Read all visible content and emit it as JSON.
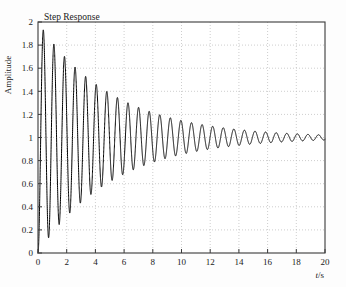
{
  "chart_data": {
    "type": "line",
    "title": "Step Response",
    "xlabel": "t/s",
    "ylabel": "Amplitude",
    "xlim": [
      0,
      20
    ],
    "ylim": [
      0,
      2
    ],
    "xticks": [
      0,
      2,
      4,
      6,
      8,
      10,
      12,
      14,
      16,
      18,
      20
    ],
    "xtick_labels": [
      "0",
      "2",
      "4",
      "6",
      "8",
      "10",
      "12",
      "14",
      "16",
      "18",
      "20"
    ],
    "yticks": [
      0,
      0.2,
      0.4,
      0.6,
      0.8,
      1,
      1.2,
      1.4,
      1.6,
      1.8,
      2
    ],
    "ytick_labels": [
      "0",
      "0.2",
      "0.4",
      "0.6",
      "0.8",
      "1",
      "1.2",
      "1.4",
      "1.6",
      "1.8",
      "2"
    ],
    "grid": true,
    "grid_style": "dotted",
    "grid_color": "#b9b9b9",
    "line_color": "#000000",
    "line_width": 1.0,
    "legend": null,
    "annotations": [],
    "model": {
      "steady_state": 1.0,
      "damping_ratio": 0.0225,
      "natural_frequency": 8.52,
      "damped_frequency": 8.518,
      "damped_period": 0.7376
    },
    "peaks": [
      {
        "t": 0.36,
        "y": 1.96
      },
      {
        "t": 1.1,
        "y": 1.83
      },
      {
        "t": 1.84,
        "y": 1.72
      },
      {
        "t": 2.57,
        "y": 1.63
      },
      {
        "t": 3.31,
        "y": 1.55
      },
      {
        "t": 4.05,
        "y": 1.48
      },
      {
        "t": 4.79,
        "y": 1.42
      },
      {
        "t": 5.52,
        "y": 1.36
      },
      {
        "t": 6.26,
        "y": 1.31
      },
      {
        "t": 7.0,
        "y": 1.28
      },
      {
        "t": 7.73,
        "y": 1.25
      },
      {
        "t": 8.47,
        "y": 1.22
      },
      {
        "t": 9.21,
        "y": 1.2
      },
      {
        "t": 9.95,
        "y": 1.18
      },
      {
        "t": 10.68,
        "y": 1.16
      },
      {
        "t": 11.42,
        "y": 1.14
      },
      {
        "t": 12.16,
        "y": 1.13
      },
      {
        "t": 12.89,
        "y": 1.12
      },
      {
        "t": 13.63,
        "y": 1.11
      },
      {
        "t": 14.37,
        "y": 1.1
      },
      {
        "t": 15.11,
        "y": 1.09
      },
      {
        "t": 15.84,
        "y": 1.08
      },
      {
        "t": 16.58,
        "y": 1.08
      },
      {
        "t": 17.32,
        "y": 1.07
      },
      {
        "t": 18.05,
        "y": 1.07
      },
      {
        "t": 18.79,
        "y": 1.06
      },
      {
        "t": 19.53,
        "y": 1.06
      }
    ],
    "troughs": [
      {
        "t": 0.73,
        "y": 0.19
      },
      {
        "t": 1.47,
        "y": 0.3
      },
      {
        "t": 2.21,
        "y": 0.39
      },
      {
        "t": 2.94,
        "y": 0.49
      },
      {
        "t": 3.68,
        "y": 0.56
      },
      {
        "t": 4.42,
        "y": 0.63
      },
      {
        "t": 5.16,
        "y": 0.69
      },
      {
        "t": 5.89,
        "y": 0.74
      },
      {
        "t": 6.63,
        "y": 0.78
      },
      {
        "t": 7.37,
        "y": 0.8
      },
      {
        "t": 8.1,
        "y": 0.82
      },
      {
        "t": 8.84,
        "y": 0.84
      },
      {
        "t": 9.58,
        "y": 0.86
      },
      {
        "t": 10.32,
        "y": 0.87
      },
      {
        "t": 11.05,
        "y": 0.88
      },
      {
        "t": 11.79,
        "y": 0.89
      },
      {
        "t": 12.53,
        "y": 0.9
      },
      {
        "t": 13.26,
        "y": 0.91
      },
      {
        "t": 14.0,
        "y": 0.92
      },
      {
        "t": 14.74,
        "y": 0.92
      },
      {
        "t": 15.48,
        "y": 0.93
      },
      {
        "t": 16.21,
        "y": 0.93
      },
      {
        "t": 16.95,
        "y": 0.94
      },
      {
        "t": 17.69,
        "y": 0.94
      },
      {
        "t": 18.42,
        "y": 0.94
      },
      {
        "t": 19.16,
        "y": 0.95
      },
      {
        "t": 19.9,
        "y": 0.95
      }
    ]
  },
  "figure": {
    "background": "#ffffff",
    "axes_color": "#3a3a3a"
  }
}
